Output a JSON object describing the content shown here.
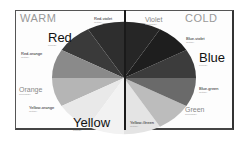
{
  "diagram": {
    "headings": {
      "warm": "WARM",
      "cold": "COLD"
    },
    "labels": {
      "red": {
        "name": "Red",
        "type": "Primary"
      },
      "red_violet": {
        "name": "Red-violet",
        "type": "Tertiary"
      },
      "red_orange": {
        "name": "Red-orange",
        "type": "Tertiary"
      },
      "orange": {
        "name": "Orange",
        "type": "Secondary"
      },
      "yellow_orange": {
        "name": "Yellow-orange",
        "type": "Tertiary"
      },
      "yellow": {
        "name": "Yellow",
        "type": "Primary"
      },
      "violet": {
        "name": "Violet",
        "type": "Secondary"
      },
      "blue_violet": {
        "name": "Blue-violet",
        "type": "Tertiary"
      },
      "blue": {
        "name": "Blue",
        "type": "Primary"
      },
      "blue_green": {
        "name": "Blue-green",
        "type": "Tertiary"
      },
      "green": {
        "name": "Green",
        "type": "Secondary"
      },
      "yellow_green": {
        "name": "Yellow-Green",
        "type": "Tertiary"
      }
    },
    "segment_colors": {
      "red": "#3a3a3a",
      "red_violet": "#2e2e2e",
      "violet": "#262626",
      "blue_violet": "#1e1e1e",
      "blue": "#3c3c3c",
      "blue_green": "#6a6a6a",
      "green": "#b8b8b8",
      "yellow_green": "#e6e6e6",
      "yellow": "#f0f0f0",
      "yellow_orange": "#e9e9e9",
      "orange": "#b5b5b5",
      "red_orange": "#8a8a8a"
    }
  }
}
